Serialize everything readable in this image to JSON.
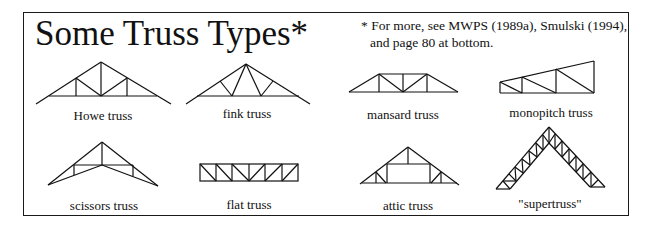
{
  "title": "Some Truss Types*",
  "note": {
    "line1": "* For more, see MWPS (1989a), Smulski (1994),",
    "line2": "and page 80 at bottom."
  },
  "trusses": [
    {
      "id": "howe",
      "label": "Howe truss"
    },
    {
      "id": "fink",
      "label": "fink truss"
    },
    {
      "id": "mansard",
      "label": "mansard truss"
    },
    {
      "id": "monopitch",
      "label": "monopitch truss"
    },
    {
      "id": "scissors",
      "label": "scissors truss"
    },
    {
      "id": "flat",
      "label": "flat truss"
    },
    {
      "id": "attic",
      "label": "attic truss"
    },
    {
      "id": "supertruss",
      "label": "\"supertruss\""
    }
  ]
}
